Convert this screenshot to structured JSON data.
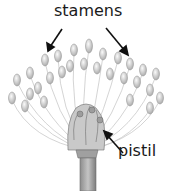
{
  "diagram": {
    "labels": {
      "stamens": "stamens",
      "pistil": "pistil"
    },
    "colors": {
      "text": "#1a1a1a",
      "arrow": "#111111",
      "anther_fill": "#d9d9d9",
      "filament": "#bdbdbd",
      "stem": "#9a9a9a"
    }
  }
}
